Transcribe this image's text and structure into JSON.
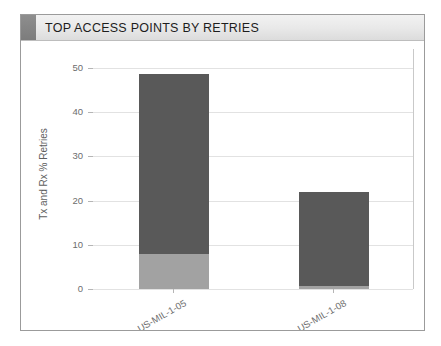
{
  "panel": {
    "title": "TOP ACCESS POINTS BY RETRIES",
    "accent_color": "#8e8e8e",
    "header_bg": "#e8e8e8",
    "border_color": "#9b9b9b"
  },
  "chart_data": {
    "type": "bar",
    "stacked": true,
    "title": "TOP ACCESS POINTS BY RETRIES",
    "xlabel": "",
    "ylabel": "Tx and Rx % Retries",
    "categories": [
      "US-MIL-1-05",
      "US-MIL-1-08"
    ],
    "ylim": [
      0,
      52
    ],
    "yticks": [
      0,
      10,
      20,
      30,
      40,
      50
    ],
    "ytick_labels": [
      "0",
      "10",
      "20",
      "30",
      "40",
      "50"
    ],
    "grid": true,
    "legend": "none",
    "series": [
      {
        "name": "Rx Retries",
        "color": "#a2a2a2",
        "values": [
          8.0,
          0.7
        ]
      },
      {
        "name": "Tx Retries",
        "color": "#595959",
        "values": [
          40.5,
          21.3
        ]
      }
    ],
    "totals": [
      48.5,
      22.0
    ],
    "xtick_label_rotation": 30
  }
}
